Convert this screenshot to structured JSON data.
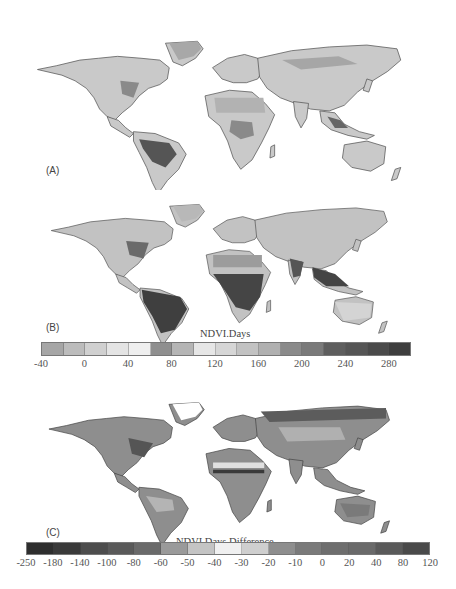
{
  "figure": {
    "panels": [
      {
        "id": "A",
        "label": "(A)",
        "description": "World map of NDVI.Days (baseline)"
      },
      {
        "id": "B",
        "label": "(B)",
        "description": "World map of NDVI.Days (scenario)"
      },
      {
        "id": "C",
        "label": "(C)",
        "description": "World map of NDVI.Days Difference"
      }
    ],
    "colorbar_ndvi": {
      "title": "NDVI.Days",
      "ticks": [
        "-40",
        "0",
        "40",
        "80",
        "120",
        "160",
        "200",
        "240",
        "280"
      ],
      "colors": [
        "#a6a6a6",
        "#bcbcbc",
        "#d0d0d0",
        "#e4e4e4",
        "#efefef",
        "#8f8f8f",
        "#b5b5b5",
        "#e6e6e6",
        "#d6d6d6",
        "#c2c2c2",
        "#b0b0b0",
        "#8a8a8a",
        "#7a7a7a",
        "#5e5e5e",
        "#555555",
        "#4a4a4a",
        "#3e3e3e"
      ]
    },
    "colorbar_diff": {
      "title": "NDVI.Days Difference",
      "ticks": [
        "-250",
        "-180",
        "-140",
        "-100",
        "-80",
        "-60",
        "-50",
        "-40",
        "-30",
        "-20",
        "-10",
        "0",
        "20",
        "40",
        "80",
        "120"
      ],
      "colors": [
        "#2e2e2e",
        "#3a3a3a",
        "#4d4d4d",
        "#5a5a5a",
        "#6a6a6a",
        "#9a9a9a",
        "#c4c4c4",
        "#f0f0f0",
        "#cfcfcf",
        "#8e8e8e",
        "#7a7a7a",
        "#6e6e6e",
        "#6a6a6a",
        "#5a5a5a",
        "#4a4a4a"
      ]
    }
  },
  "chart_data": [
    {
      "type": "heatmap",
      "title": "(A) NDVI.Days",
      "xlabel": "",
      "ylabel": "",
      "legend": {
        "title": "NDVI.Days",
        "ticks": [
          -40,
          0,
          40,
          80,
          120,
          160,
          200,
          240,
          280
        ],
        "range": [
          -40,
          300
        ]
      },
      "notes": "Global map; highest values (darkest) over Amazon basin, Congo basin, SE Asia; low values in deserts/high latitudes"
    },
    {
      "type": "heatmap",
      "title": "(B) NDVI.Days",
      "xlabel": "",
      "ylabel": "",
      "legend": {
        "title": "NDVI.Days",
        "ticks": [
          -40,
          0,
          40,
          80,
          120,
          160,
          200,
          240,
          280
        ],
        "range": [
          -40,
          300
        ]
      },
      "notes": "Global map; darker overall than (A), esp. tropical South America, Central Africa, South/SE Asia, eastern US"
    },
    {
      "type": "heatmap",
      "title": "(C) NDVI.Days Difference",
      "xlabel": "",
      "ylabel": "",
      "legend": {
        "title": "NDVI.Days Difference",
        "ticks": [
          -250,
          -180,
          -140,
          -100,
          -80,
          -60,
          -50,
          -40,
          -30,
          -20,
          -10,
          0,
          20,
          40,
          80,
          120
        ],
        "range": [
          -250,
          120
        ]
      },
      "notes": "Difference map B vs A; strong band across Sahel, darker values across boreal Eurasia and eastern North America"
    }
  ]
}
